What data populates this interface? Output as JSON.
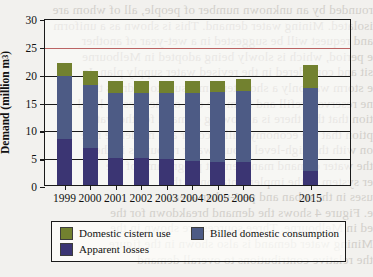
{
  "page_bleed_lines": [
    "rounded by an unknown number of people, all of whom are",
    "isolated. Mining water demand. This is shown as a uniform",
    "and request will be suggested in a wet-year of another",
    "e period, which is slowly being adopted in Melbourne",
    "sit and considered in the revised water supply plan. In",
    "e storm was only a short-term measure to address the",
    "ne reservoir refill and from the end of the present level",
    "tion that that there is a growing demand for the water",
    "ption that the economy will recover at a moderate rate",
    "on with the high-level groundwater resources in the",
    "the water demand management programme of the",
    "er system in the implementation of the",
    "uses in the urban and peri-urban areas",
    "e. Figure 4 shows the demand breakdown for the",
    "ed in Melbourne. Three sources are shown in the",
    "Mining water demand is also shown in the figure",
    "the relative contributions to overall demand"
  ],
  "chart_data": {
    "type": "bar",
    "subtype": "stacked-bar",
    "title": "",
    "xlabel": "",
    "ylabel": "Demand (million m",
    "ylabel_sup": "3",
    "ylabel_suffix": ")",
    "ylabel_full": "Demand (million m³)",
    "ylim": [
      0,
      30
    ],
    "yticks": [
      0,
      5,
      10,
      15,
      20,
      25,
      30
    ],
    "ytick_labels": [
      "0",
      "5",
      "10",
      "15",
      "20",
      "25",
      "30"
    ],
    "grid": true,
    "grid_axis": "y",
    "legend_position": "below-plot",
    "categories": [
      "1999",
      "2000",
      "2001",
      "2002",
      "2003",
      "2004",
      "2005",
      "2006",
      "2015"
    ],
    "category_gap_after": "2006",
    "series": [
      {
        "name": "Apparent losses",
        "color": "#3b3573",
        "values": [
          8.2,
          6.6,
          4.9,
          4.9,
          4.7,
          4.4,
          4.2,
          4.1,
          2.6
        ]
      },
      {
        "name": "Billed domestic consumption",
        "color": "#4d5b85",
        "values": [
          11.4,
          11.4,
          11.6,
          11.7,
          11.9,
          12.2,
          12.5,
          12.8,
          14.9
        ]
      },
      {
        "name": "Domestic cistern use",
        "color": "#72812f",
        "values": [
          2.4,
          2.5,
          2.1,
          2.0,
          2.0,
          2.0,
          2.0,
          2.2,
          4.0
        ]
      }
    ],
    "totals": [
      22.0,
      20.5,
      18.6,
      18.6,
      18.6,
      18.6,
      18.7,
      19.1,
      21.5
    ],
    "annotations": []
  },
  "legend": {
    "entries": [
      {
        "label": "Domestic cistern use",
        "color": "#72812f"
      },
      {
        "label": "Billed domestic consumption",
        "color": "#4d5b85"
      },
      {
        "label": "Apparent losses",
        "color": "#3b3573"
      }
    ]
  },
  "colors": {
    "axis": "#1a1a1a",
    "page_background": "#f2f1ee",
    "plot_background": "#fcfcfa",
    "red_rule": "#b04a4a"
  }
}
